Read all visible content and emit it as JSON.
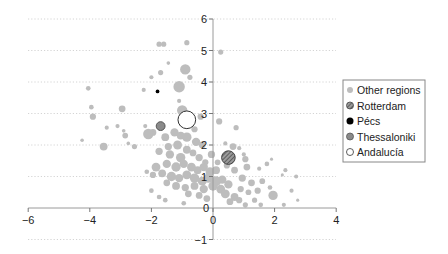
{
  "chart_data": {
    "type": "scatter",
    "title": "",
    "xlabel": "",
    "ylabel": "",
    "xlim": [
      -6,
      4
    ],
    "ylim": [
      -1,
      6
    ],
    "x_ticks": [
      -6,
      -4,
      -2,
      0,
      2,
      4
    ],
    "x_tick_labels": [
      "−6",
      "−4",
      "−2",
      "0",
      "2",
      "4"
    ],
    "y_ticks": [
      -1,
      0,
      1,
      2,
      3,
      4,
      5,
      6
    ],
    "y_tick_labels": [
      "−1",
      "0",
      "1",
      "2",
      "3",
      "4",
      "5",
      "6"
    ],
    "grid": "horizontal dotted",
    "legend_position": "right",
    "legend": [
      {
        "label": "Other regions",
        "style": "gray-filled",
        "color": "#bdbdbd"
      },
      {
        "label": "Rotterdam",
        "style": "hatched",
        "color": "#555555"
      },
      {
        "label": "Pécs",
        "style": "black-filled",
        "color": "#000000"
      },
      {
        "label": "Thessaloniki",
        "style": "dark-gray-filled",
        "color": "#8a8a8a"
      },
      {
        "label": "Andalucía",
        "style": "open-circle",
        "color": "#ffffff"
      }
    ],
    "series": [
      {
        "name": "Other regions",
        "points": [
          [
            -1.75,
            5.2,
            1
          ],
          [
            -1.6,
            5.2,
            1
          ],
          [
            -0.85,
            5.25,
            1
          ],
          [
            0.25,
            4.95,
            1
          ],
          [
            -1.45,
            4.6,
            0.7
          ],
          [
            -1.7,
            4.3,
            1
          ],
          [
            -0.9,
            4.4,
            2
          ],
          [
            -2.0,
            4.15,
            0.8
          ],
          [
            -0.75,
            4.15,
            1
          ],
          [
            -0.95,
            4.3,
            0.6
          ],
          [
            -4.05,
            3.8,
            0.9
          ],
          [
            -2.25,
            3.75,
            0.8
          ],
          [
            -1.1,
            3.85,
            2.2
          ],
          [
            -1.1,
            3.4,
            0.8
          ],
          [
            -1.0,
            3.1,
            2
          ],
          [
            -3.95,
            3.2,
            0.9
          ],
          [
            -2.95,
            3.15,
            1.3
          ],
          [
            -0.8,
            2.85,
            1
          ],
          [
            -0.4,
            2.9,
            1.2
          ],
          [
            -1.0,
            2.7,
            1.3
          ],
          [
            -3.9,
            2.9,
            1.2
          ],
          [
            -3.45,
            2.55,
            0.8
          ],
          [
            -3.1,
            2.6,
            0.8
          ],
          [
            -2.9,
            2.45,
            0.7
          ],
          [
            -2.85,
            2.3,
            1.1
          ],
          [
            -2.2,
            2.6,
            0.8
          ],
          [
            -1.95,
            2.4,
            1.3
          ],
          [
            -0.6,
            2.5,
            1.2
          ],
          [
            -4.25,
            2.15,
            0.7
          ],
          [
            -3.55,
            1.95,
            1.5
          ],
          [
            -2.75,
            2.05,
            0.7
          ],
          [
            -2.55,
            1.95,
            1
          ],
          [
            -2.1,
            2.35,
            2
          ],
          [
            -1.55,
            2.25,
            1.5
          ],
          [
            -1.25,
            2.4,
            1.6
          ],
          [
            -1.05,
            2.3,
            1.5
          ],
          [
            -0.85,
            2.25,
            1.8
          ],
          [
            -0.55,
            2.1,
            1.6
          ],
          [
            -0.35,
            2.0,
            1.3
          ],
          [
            -1.45,
            1.95,
            1.4
          ],
          [
            -1.15,
            2.0,
            1.7
          ],
          [
            -0.85,
            1.85,
            1.5
          ],
          [
            -0.65,
            1.75,
            1.3
          ],
          [
            -1.75,
            1.8,
            1.4
          ],
          [
            -1.4,
            1.7,
            1.6
          ],
          [
            -1.05,
            1.6,
            1.8
          ],
          [
            -0.45,
            1.6,
            1.4
          ],
          [
            -0.25,
            1.45,
            1.2
          ],
          [
            -1.85,
            1.3,
            1.7
          ],
          [
            -1.5,
            1.4,
            1.6
          ],
          [
            -1.2,
            1.3,
            1.8
          ],
          [
            -0.95,
            1.4,
            1.6
          ],
          [
            -0.7,
            1.3,
            1.7
          ],
          [
            -0.5,
            1.2,
            1.5
          ],
          [
            -0.3,
            1.3,
            1.6
          ],
          [
            -0.1,
            1.15,
            1.7
          ],
          [
            0.1,
            1.2,
            1.5
          ],
          [
            -2.15,
            1.15,
            0.9
          ],
          [
            -1.95,
            1.05,
            1.2
          ],
          [
            -1.65,
            1.1,
            1.5
          ],
          [
            -1.35,
            1.0,
            1.8
          ],
          [
            -1.1,
            0.95,
            1.6
          ],
          [
            -0.85,
            1.05,
            1.7
          ],
          [
            -0.6,
            0.95,
            1.8
          ],
          [
            -0.35,
            0.85,
            1.7
          ],
          [
            -0.15,
            0.95,
            1.8
          ],
          [
            0.1,
            0.85,
            1.9
          ],
          [
            0.3,
            0.9,
            1.6
          ],
          [
            0.5,
            0.75,
            1.6
          ],
          [
            -1.5,
            0.8,
            1.3
          ],
          [
            -1.2,
            0.7,
            1.5
          ],
          [
            -0.9,
            0.65,
            1.4
          ],
          [
            -0.6,
            0.7,
            1.5
          ],
          [
            -0.3,
            0.6,
            1.6
          ],
          [
            0.0,
            0.7,
            1.8
          ],
          [
            0.25,
            0.6,
            1.7
          ],
          [
            -2.0,
            0.55,
            0.9
          ],
          [
            -0.8,
            0.45,
            1.3
          ],
          [
            -0.45,
            0.4,
            1.3
          ],
          [
            0.4,
            0.45,
            1.7
          ],
          [
            0.7,
            0.35,
            1.5
          ],
          [
            -1.75,
            0.35,
            0.9
          ],
          [
            -1.55,
            0.25,
            0.9
          ],
          [
            -0.2,
            0.3,
            1.3
          ],
          [
            0.55,
            0.2,
            1.3
          ],
          [
            0.85,
            0.25,
            1.2
          ],
          [
            -0.95,
            0.15,
            0.9
          ],
          [
            1.05,
            0.1,
            1
          ],
          [
            1.35,
            0.25,
            1
          ],
          [
            1.55,
            0.1,
            0.9
          ],
          [
            1.95,
            0.4,
            1.8
          ],
          [
            2.3,
            0.1,
            0.8
          ],
          [
            2.55,
            0.55,
            0.8
          ],
          [
            2.75,
            0.25,
            0.6
          ],
          [
            2.35,
            1.2,
            0.8
          ],
          [
            2.7,
            1.0,
            0.8
          ],
          [
            2.25,
            1.05,
            0.6
          ],
          [
            1.75,
            1.4,
            0.9
          ],
          [
            1.5,
            1.25,
            0.8
          ],
          [
            1.9,
            1.55,
            0.6
          ],
          [
            1.0,
            1.7,
            0.8
          ],
          [
            1.05,
            1.55,
            1.2
          ],
          [
            0.65,
            1.95,
            1.3
          ],
          [
            0.85,
            1.9,
            0.8
          ],
          [
            0.4,
            2.05,
            0.8
          ],
          [
            0.75,
            2.55,
            1
          ],
          [
            0.2,
            2.75,
            1.2
          ],
          [
            1.1,
            1.3,
            1.3
          ],
          [
            0.95,
            0.95,
            1.4
          ],
          [
            1.25,
            0.8,
            1.3
          ],
          [
            1.6,
            0.85,
            1.1
          ],
          [
            1.85,
            0.65,
            0.9
          ],
          [
            1.45,
            0.55,
            1.2
          ],
          [
            1.15,
            0.5,
            1.1
          ],
          [
            0.9,
            0.6,
            1.2
          ],
          [
            0.7,
            1.2,
            1.3
          ],
          [
            0.45,
            1.35,
            1.2
          ],
          [
            0.15,
            1.45,
            1.1
          ],
          [
            -0.05,
            1.7,
            1.4
          ]
        ]
      },
      {
        "name": "Rotterdam",
        "points": [
          [
            0.5,
            1.6,
            2
          ]
        ]
      },
      {
        "name": "Pécs",
        "points": [
          [
            -1.8,
            3.7,
            0.55
          ]
        ]
      },
      {
        "name": "Thessaloniki",
        "points": [
          [
            -1.7,
            2.6,
            1.3
          ]
        ]
      },
      {
        "name": "Andalucía",
        "points": [
          [
            -0.85,
            2.8,
            2.6
          ]
        ]
      }
    ]
  }
}
